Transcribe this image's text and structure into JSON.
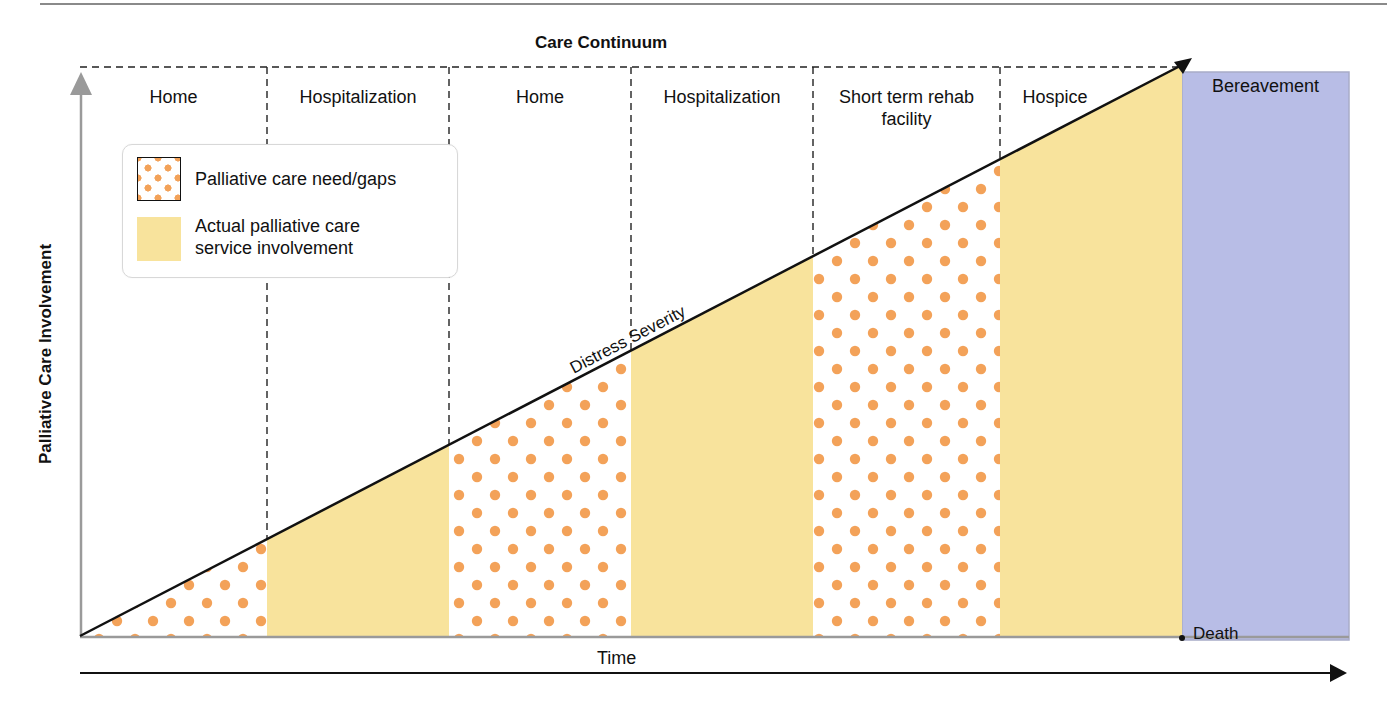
{
  "title": "Care Continuum",
  "y_axis_label": "Palliative Care Involvement",
  "x_axis_label": "Time",
  "diagonal_label": "Distress Severity",
  "end_marker_label": "Death",
  "bereavement_label": "Bereavement",
  "settings": [
    {
      "label": "Home",
      "fill": "dots"
    },
    {
      "label": "Hospitalization",
      "fill": "solid"
    },
    {
      "label": "Home",
      "fill": "dots"
    },
    {
      "label": "Hospitalization",
      "fill": "solid"
    },
    {
      "label": "Short term rehab facility",
      "line1": "Short term rehab",
      "line2": "facility",
      "fill": "dots"
    },
    {
      "label": "Hospice",
      "fill": "solid"
    }
  ],
  "legend": {
    "items": [
      {
        "label": "Palliative care need/gaps",
        "swatch": "orange-dots"
      },
      {
        "label_line1": "Actual palliative care",
        "label_line2": "service involvement",
        "swatch": "yellow-solid"
      }
    ]
  },
  "colors": {
    "dots": "#f3a259",
    "actual_involvement": "#f8e39c",
    "bereavement": "#b8bde6",
    "line": "#111111",
    "axis_gray": "#9a9a9a"
  }
}
